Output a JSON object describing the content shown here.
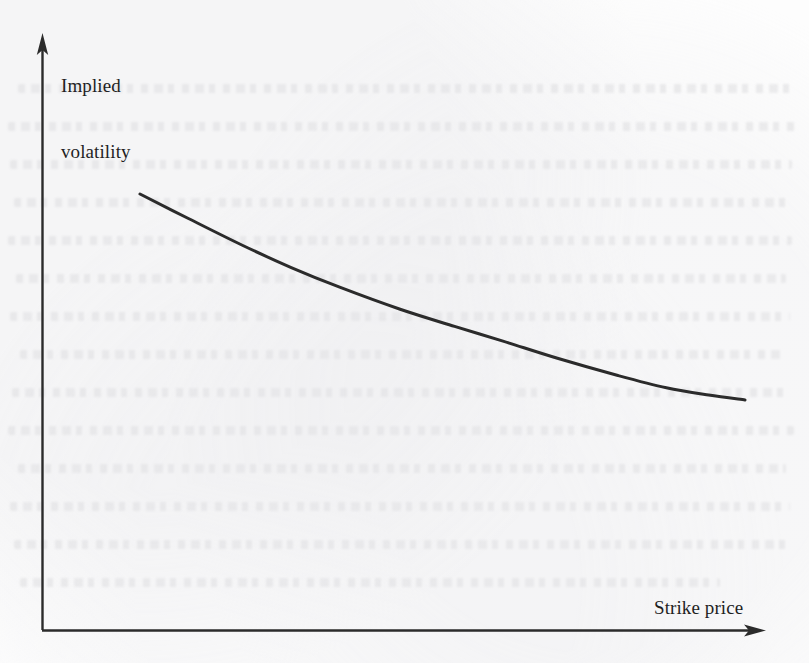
{
  "figure": {
    "kind": "line-plot",
    "caption_text": "",
    "background_color": "#fdfdfd",
    "ink_color": "#2b2b2b",
    "label_color": "#1f1f1f",
    "y_axis": {
      "label": "Implied\nvolatility",
      "label_line_1": "Implied",
      "label_line_2": "volatility",
      "has_arrow_head": true,
      "has_tick_labels": false
    },
    "x_axis": {
      "label": "Strike price",
      "has_arrow_head": true,
      "has_tick_labels": false
    }
  },
  "chart_data": {
    "type": "line",
    "title": "",
    "xlabel": "Strike price",
    "ylabel": "Implied volatility",
    "grid": false,
    "legend": null,
    "axis_ticks": false,
    "axis_arrows": true,
    "xlim": [
      0,
      1
    ],
    "ylim": [
      0,
      1
    ],
    "series": [
      {
        "name": "implied volatility skew",
        "color": "#2b2b2b",
        "line_width_px": 3,
        "x": [
          0.0,
          0.08,
          0.17,
          0.25,
          0.33,
          0.43,
          0.52,
          0.6,
          0.69,
          0.79,
          0.87,
          0.94,
          1.0
        ],
        "y": [
          1.0,
          0.9,
          0.79,
          0.7,
          0.62,
          0.53,
          0.46,
          0.4,
          0.33,
          0.26,
          0.21,
          0.18,
          0.16
        ]
      }
    ]
  }
}
